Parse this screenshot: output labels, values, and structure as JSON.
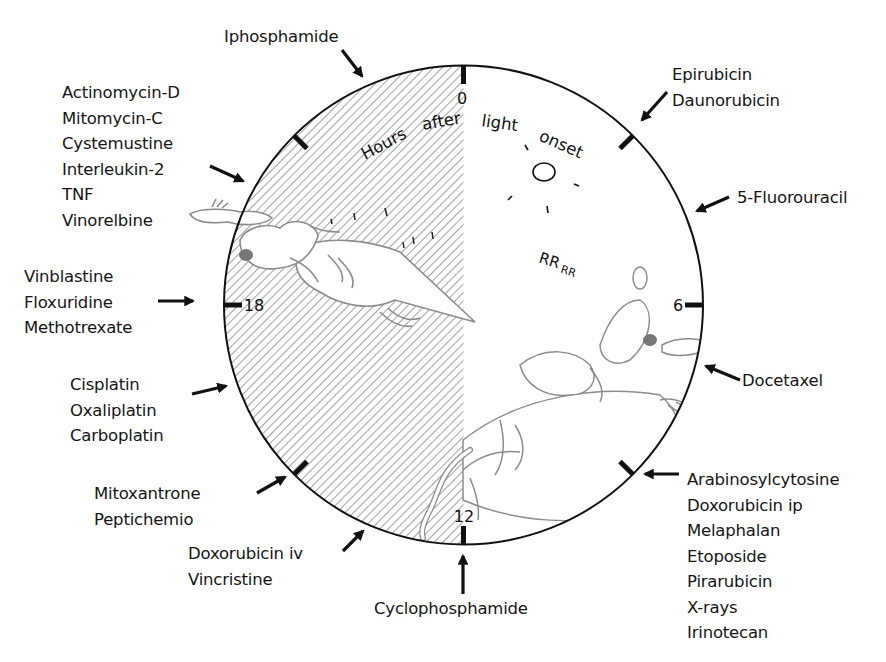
{
  "diagram": {
    "type": "circadian-clock",
    "axis_label_words": [
      "Hours",
      "after",
      "light",
      "onset"
    ],
    "hour_ticks": [
      {
        "hour": 0,
        "label": "0"
      },
      {
        "hour": 3,
        "label": ""
      },
      {
        "hour": 6,
        "label": "6"
      },
      {
        "hour": 9,
        "label": ""
      },
      {
        "hour": 12,
        "label": "12"
      },
      {
        "hour": 15,
        "label": ""
      },
      {
        "hour": 18,
        "label": "18"
      },
      {
        "hour": 21,
        "label": ""
      }
    ],
    "phases": {
      "light": {
        "from_hour": 0,
        "to_hour": 12,
        "fill": "white",
        "mouse": "sleeping mouse"
      },
      "dark": {
        "from_hour": 12,
        "to_hour": 24,
        "fill": "hatched",
        "mouse": "running mouse"
      }
    },
    "snore_text": {
      "big": "RR",
      "small": "RR"
    },
    "colors": {
      "outline": "#111111",
      "hatch": "#8a8a8a",
      "sketch": "#8c8c8c",
      "text": "#151515"
    }
  },
  "drug_groups": [
    {
      "id": "iphosphamide",
      "approx_hour": 23,
      "drugs": [
        "Iphosphamide"
      ]
    },
    {
      "id": "epirubicin",
      "approx_hour": 3,
      "drugs": [
        "Epirubicin",
        "Daunorubicin"
      ]
    },
    {
      "id": "fluorouracil",
      "approx_hour": 4.3,
      "drugs": [
        "5-Fluorouracil"
      ]
    },
    {
      "id": "actinomycin",
      "approx_hour": 20,
      "drugs": [
        "Actinomycin-D",
        "Mitomycin-C",
        "Cystemustine",
        "Interleukin-2",
        "TNF",
        "Vinorelbine"
      ]
    },
    {
      "id": "vinblastine",
      "approx_hour": 18,
      "drugs": [
        "Vinblastine",
        "Floxuridine",
        "Methotrexate"
      ]
    },
    {
      "id": "docetaxel",
      "approx_hour": 7.2,
      "drugs": [
        "Docetaxel"
      ]
    },
    {
      "id": "cisplatin",
      "approx_hour": 16.5,
      "drugs": [
        "Cisplatin",
        "Oxaliplatin",
        "Carboplatin"
      ]
    },
    {
      "id": "arabinosylcytosine",
      "approx_hour": 9,
      "drugs": [
        "Arabinosylcytosine",
        "Doxorubicin ip",
        "Melaphalan",
        "Etoposide",
        "Pirarubicin",
        "X-rays",
        "Irinotecan"
      ]
    },
    {
      "id": "mitoxantrone",
      "approx_hour": 15,
      "drugs": [
        "Mitoxantrone",
        "Peptichemio"
      ]
    },
    {
      "id": "doxorubicin-iv",
      "approx_hour": 13.8,
      "drugs": [
        "Doxorubicin iv",
        "Vincristine"
      ]
    },
    {
      "id": "cyclophosphamide",
      "approx_hour": 12,
      "drugs": [
        "Cyclophosphamide"
      ]
    }
  ]
}
